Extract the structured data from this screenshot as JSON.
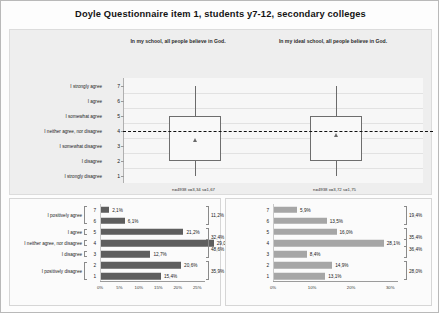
{
  "title": "Doyle Questionnaire item 1, students y7-12, secondary colleges",
  "boxplot": {
    "subtitle_left": "In my school, all people believe in God.",
    "subtitle_right": "In my ideal school, all people believe in God.",
    "y_scale": [
      {
        "num": "7",
        "label": "I strongly agree"
      },
      {
        "num": "6",
        "label": "I agree"
      },
      {
        "num": "5",
        "label": "I somewhat agree"
      },
      {
        "num": "4",
        "label": "I neither agree, nor disagree"
      },
      {
        "num": "3",
        "label": "I somewhat disagree"
      },
      {
        "num": "2",
        "label": "I disagree"
      },
      {
        "num": "1",
        "label": "I strongly disagree"
      }
    ],
    "reference_value": 4,
    "groups": [
      {
        "name": "In my school",
        "stats_text": "n=4938 x=3,34 s=1,67",
        "n": 4938,
        "mean": 3.34,
        "sd": 1.67,
        "q1": 2,
        "q3": 5,
        "whisker_low": 1,
        "whisker_high": 7
      },
      {
        "name": "In my ideal school",
        "stats_text": "n=4938 x=3,72 s=1,75",
        "n": 4938,
        "mean": 3.72,
        "sd": 1.75,
        "q1": 2,
        "q3": 5,
        "whisker_low": 1,
        "whisker_high": 7
      }
    ]
  },
  "chart_data": [
    {
      "type": "bar",
      "title": "In my school, all people believe in God.",
      "orientation": "horizontal",
      "categories": [
        "7",
        "6",
        "5",
        "4",
        "3",
        "2",
        "1"
      ],
      "values": [
        2.1,
        6.1,
        21.2,
        29.0,
        12.7,
        20.6,
        15.4
      ],
      "value_labels": [
        "2,1%",
        "6,1%",
        "21,2%",
        "29,0%",
        "12,7%",
        "20,6%",
        "15,4%"
      ],
      "row_labels": [
        {
          "text": "I positively agree",
          "rows": [
            "7",
            "6"
          ]
        },
        {
          "text": "I agree",
          "rows": [
            "5"
          ]
        },
        {
          "text": "I neither agree, nor disagree",
          "rows": [
            "4"
          ]
        },
        {
          "text": "I disagree",
          "rows": [
            "3"
          ]
        },
        {
          "text": "I positively disagree",
          "rows": [
            "2",
            "1"
          ]
        }
      ],
      "group_totals": [
        {
          "label": "11,2%",
          "rows": [
            "7",
            "6"
          ]
        },
        {
          "label": "32,4%",
          "rows": [
            "5",
            "4"
          ]
        },
        {
          "label": "48,6%",
          "rows": [
            "4",
            "3"
          ]
        },
        {
          "label": "35,9%",
          "rows": [
            "2",
            "1"
          ]
        }
      ],
      "xticks": [
        "0%",
        "5%",
        "10%",
        "15%",
        "20%",
        "25%"
      ],
      "xlabel": "",
      "ylabel": "",
      "xlim": [
        0,
        27
      ]
    },
    {
      "type": "bar",
      "title": "In my ideal school, all people believe in God.",
      "orientation": "horizontal",
      "categories": [
        "7",
        "6",
        "5",
        "4",
        "3",
        "2",
        "1"
      ],
      "values": [
        5.9,
        13.5,
        16.0,
        28.1,
        8.4,
        14.9,
        13.1
      ],
      "value_labels": [
        "5,9%",
        "13,5%",
        "16,0%",
        "28,1%",
        "8,4%",
        "14,9%",
        "13,1%"
      ],
      "group_totals": [
        {
          "label": "19,4%",
          "rows": [
            "7",
            "6"
          ]
        },
        {
          "label": "35,4%",
          "rows": [
            "5",
            "4"
          ]
        },
        {
          "label": "36,4%",
          "rows": [
            "4",
            "3"
          ]
        },
        {
          "label": "28,0%",
          "rows": [
            "2",
            "1"
          ]
        }
      ],
      "xticks": [
        "0%",
        "10%",
        "20%",
        "30%"
      ],
      "xlabel": "",
      "ylabel": "",
      "xlim": [
        0,
        32
      ]
    }
  ]
}
